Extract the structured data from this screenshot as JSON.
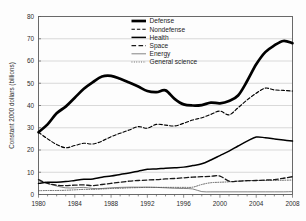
{
  "chart_data": {
    "type": "line",
    "title": "",
    "xlabel": "",
    "ylabel": "Constant 2000 dollars (billions)",
    "xlim": [
      1980,
      2008
    ],
    "ylim": [
      0,
      80
    ],
    "ytick_step": 10,
    "grid": "horizontal",
    "legend_position": "top-center",
    "x_tick_labels": [
      "1980",
      "1984",
      "1988",
      "1992",
      "1996",
      "2000",
      "2004",
      "2008"
    ],
    "y_tick_labels": [
      "0",
      "10",
      "20",
      "30",
      "40",
      "50",
      "60",
      "70",
      "80"
    ],
    "x": [
      1980,
      1981,
      1982,
      1983,
      1984,
      1985,
      1986,
      1987,
      1988,
      1989,
      1990,
      1991,
      1992,
      1993,
      1994,
      1995,
      1996,
      1997,
      1998,
      1999,
      2000,
      2001,
      2002,
      2003,
      2004,
      2005,
      2006,
      2007,
      2008
    ],
    "series": [
      {
        "name": "Defense",
        "style": "solid-thick",
        "values": [
          28.0,
          31.5,
          36.5,
          39.5,
          43.5,
          47.5,
          50.5,
          53.0,
          53.3,
          52.0,
          50.3,
          48.5,
          46.5,
          46.0,
          46.8,
          43.0,
          40.5,
          40.0,
          40.2,
          41.3,
          41.0,
          42.0,
          44.5,
          51.0,
          58.5,
          64.0,
          67.0,
          69.0,
          68.0
        ]
      },
      {
        "name": "Nondefense",
        "style": "dashed",
        "values": [
          28.0,
          25.0,
          22.5,
          21.0,
          22.0,
          23.0,
          22.7,
          24.0,
          26.0,
          27.5,
          29.0,
          30.5,
          29.8,
          31.5,
          31.2,
          30.8,
          32.0,
          33.5,
          34.5,
          36.0,
          37.5,
          35.8,
          39.0,
          42.5,
          45.5,
          47.8,
          47.0,
          46.8,
          46.5
        ]
      },
      {
        "name": "Health",
        "style": "solid-medium",
        "values": [
          5.0,
          5.5,
          5.5,
          5.8,
          6.3,
          6.8,
          7.0,
          7.8,
          8.3,
          9.0,
          9.7,
          10.5,
          11.3,
          11.5,
          11.8,
          12.0,
          12.3,
          13.0,
          13.8,
          15.5,
          17.5,
          19.5,
          21.8,
          24.0,
          25.8,
          25.5,
          25.0,
          24.5,
          24.0
        ]
      },
      {
        "name": "Space",
        "style": "dash-long",
        "values": [
          6.7,
          5.0,
          4.2,
          4.0,
          4.2,
          4.3,
          4.0,
          4.5,
          5.0,
          5.5,
          6.0,
          6.3,
          6.5,
          6.7,
          7.0,
          7.2,
          7.5,
          7.8,
          8.0,
          8.2,
          8.3,
          6.0,
          6.0,
          6.2,
          6.3,
          6.5,
          6.7,
          7.3,
          8.0
        ]
      },
      {
        "name": "Energy",
        "style": "solid-thin",
        "values": [
          6.2,
          5.0,
          3.8,
          3.0,
          3.0,
          3.2,
          2.7,
          2.7,
          3.0,
          3.2,
          3.3,
          3.3,
          3.3,
          3.2,
          3.0,
          2.8,
          2.7,
          2.5,
          1.3,
          1.2,
          1.2,
          1.2,
          1.2,
          1.2,
          1.2,
          1.2,
          1.2,
          1.2,
          1.3
        ]
      },
      {
        "name": "General science",
        "style": "dotted",
        "values": [
          1.7,
          1.8,
          1.8,
          1.9,
          2.1,
          2.3,
          2.3,
          2.5,
          2.7,
          2.8,
          3.0,
          3.1,
          3.2,
          3.2,
          3.2,
          3.2,
          3.2,
          3.3,
          4.5,
          5.3,
          5.5,
          5.7,
          6.0,
          6.2,
          6.3,
          6.3,
          6.3,
          6.4,
          6.5
        ]
      }
    ]
  },
  "legend": {
    "items": [
      {
        "label": "Defense"
      },
      {
        "label": "Nondefense"
      },
      {
        "label": "Health"
      },
      {
        "label": "Space"
      },
      {
        "label": "Energy"
      },
      {
        "label": "General science"
      }
    ]
  }
}
